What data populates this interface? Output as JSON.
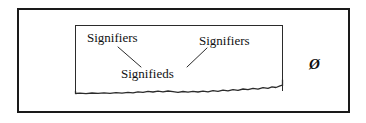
{
  "figure": {
    "background_color": "#ffffff",
    "stroke_color": "#1a1a1a",
    "text_color": "#111111",
    "outer_frame": {
      "name": "outer-frame",
      "x": 17,
      "y": 8,
      "width": 333,
      "height": 105,
      "border_width": 2
    },
    "inner_box": {
      "name": "inner-box",
      "x": 75,
      "y": 25,
      "width": 208,
      "height": 66,
      "border_width": 1.5,
      "bottom_edge_style": "hand-drawn wavy line"
    },
    "labels": [
      {
        "id": "signifiers-left",
        "text": "Signifiers",
        "x": 87,
        "y": 31
      },
      {
        "id": "signifiers-right",
        "text": "Signifiers",
        "x": 199,
        "y": 34
      },
      {
        "id": "signifieds",
        "text": "Signifieds",
        "x": 121,
        "y": 67
      }
    ],
    "symbol": {
      "id": "empty-set",
      "text": "Ø",
      "x": 309,
      "y": 56,
      "style": "bold italic"
    },
    "connectors": [
      {
        "id": "connector-left",
        "from_label": "signifiers-left",
        "to_label": "signifieds",
        "x1": 118,
        "y1": 47,
        "x2": 141,
        "y2": 67
      },
      {
        "id": "connector-right",
        "from_label": "signifiers-right",
        "to_label": "signifieds",
        "x1": 207,
        "y1": 48,
        "x2": 187,
        "y2": 67
      }
    ],
    "wavy_baseline": {
      "id": "wavy-baseline",
      "description": "jagged hand-drawn line forming the bottom of the inner box",
      "start": [
        75,
        93
      ],
      "end": [
        283,
        85
      ]
    }
  }
}
